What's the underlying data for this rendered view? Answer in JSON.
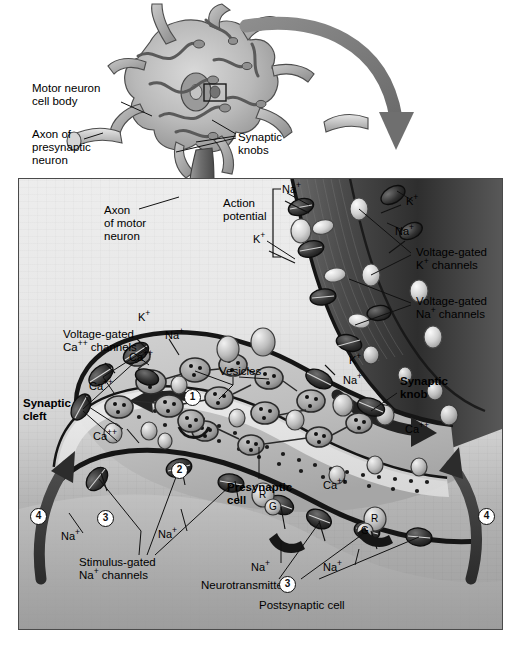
{
  "figure": {
    "domain": "biology-diagram"
  },
  "colors": {
    "panel_light": "#ededed",
    "panel_mid": "#c8c8c8",
    "panel_dark": "#a0a0a0",
    "membrane": "#2b2b2b",
    "channel_dark": "#3a3a3a",
    "channel_light": "#d8d8d8",
    "arrow_gray": "#7a7a7a",
    "border": "#4a4a4a",
    "text": "#000000"
  },
  "overview_labels": [
    {
      "id": "motor-neuron-cell-body",
      "text": "Motor neuron\ncell body",
      "x": 32,
      "y": 82
    },
    {
      "id": "axon-of-presynaptic-neuron",
      "text": "Axon of\npresynaptic\nneuron",
      "x": 32,
      "y": 128
    },
    {
      "id": "synaptic-knobs",
      "text": "Synaptic\nknobs",
      "x": 238,
      "y": 131
    }
  ],
  "panel_labels": [
    {
      "id": "axon-of-motor-neuron",
      "text": "Axon\nof motor\nneuron",
      "x": 103,
      "y": 203,
      "bold": false
    },
    {
      "id": "action-potential",
      "text": "Action\npotential",
      "x": 222,
      "y": 196,
      "bold": false
    },
    {
      "id": "voltage-gated-k-channels",
      "text": "Voltage-gated\nK⁺ channels",
      "x": 415,
      "y": 249,
      "bold": false
    },
    {
      "id": "voltage-gated-na-channels",
      "text": "Voltage-gated\nNa⁺ channels",
      "x": 415,
      "y": 297,
      "bold": false
    },
    {
      "id": "voltage-gated-ca-channels",
      "text": "Voltage-gated\nCa⁺⁺ channels",
      "x": 62,
      "y": 329,
      "bold": false
    },
    {
      "id": "synaptic-cleft",
      "text": "Synaptic\ncleft",
      "x": 22,
      "y": 400,
      "bold": true
    },
    {
      "id": "synaptic-knob",
      "text": "Synaptic\nknob",
      "x": 399,
      "y": 386,
      "bold": true
    },
    {
      "id": "vesicles",
      "text": "Vesicles",
      "x": 218,
      "y": 367,
      "bold": false
    },
    {
      "id": "presynaptic-cell",
      "text": "Presynaptic\ncell",
      "x": 228,
      "y": 490,
      "bold": true
    },
    {
      "id": "stimulus-gated-na-channels",
      "text": "Stimulus-gated\nNa⁺ channels",
      "x": 78,
      "y": 560,
      "bold": false
    },
    {
      "id": "neurotransmitters",
      "text": "Neurotransmitters",
      "x": 200,
      "y": 580,
      "bold": false
    },
    {
      "id": "postsynaptic-cell",
      "text": "Postsynaptic cell",
      "x": 258,
      "y": 600,
      "bold": false
    }
  ],
  "ion_labels": [
    {
      "id": "ion-na-1",
      "text": "Na⁺",
      "x": 281,
      "y": 190
    },
    {
      "id": "ion-k-1",
      "text": "K⁺",
      "x": 252,
      "y": 238
    },
    {
      "id": "ion-k-2",
      "text": "K⁺",
      "x": 405,
      "y": 202
    },
    {
      "id": "ion-na-2",
      "text": "Na⁺",
      "x": 394,
      "y": 232
    },
    {
      "id": "ion-k-3",
      "text": "K⁺",
      "x": 137,
      "y": 318
    },
    {
      "id": "ion-na-3",
      "text": "Na⁺",
      "x": 164,
      "y": 336
    },
    {
      "id": "ion-ca-1",
      "text": "Ca⁺⁺",
      "x": 128,
      "y": 358
    },
    {
      "id": "ion-ca-2",
      "text": "Ca⁺⁺",
      "x": 88,
      "y": 387
    },
    {
      "id": "ion-ca-3",
      "text": "Ca⁺⁺",
      "x": 92,
      "y": 437
    },
    {
      "id": "ion-k-4",
      "text": "K⁺",
      "x": 348,
      "y": 361
    },
    {
      "id": "ion-na-4",
      "text": "Na⁺",
      "x": 342,
      "y": 381
    },
    {
      "id": "ion-ca-4",
      "text": "Ca⁺⁺",
      "x": 404,
      "y": 430
    },
    {
      "id": "ion-ca-5",
      "text": "Ca⁺⁺",
      "x": 322,
      "y": 486
    },
    {
      "id": "ion-na-5",
      "text": "Na⁺",
      "x": 60,
      "y": 537
    },
    {
      "id": "ion-na-6",
      "text": "Na⁺",
      "x": 157,
      "y": 535
    },
    {
      "id": "ion-na-7",
      "text": "Na⁺",
      "x": 250,
      "y": 568
    },
    {
      "id": "ion-na-8",
      "text": "Na⁺",
      "x": 322,
      "y": 568
    },
    {
      "id": "ion-na-9",
      "text": "Na⁺",
      "x": 355,
      "y": 585
    }
  ],
  "steps": [
    {
      "id": "step-1",
      "number": "①",
      "x": 183,
      "y": 388
    },
    {
      "id": "step-2",
      "number": "②",
      "x": 170,
      "y": 461
    },
    {
      "id": "step-3a",
      "number": "③",
      "x": 96,
      "y": 509
    },
    {
      "id": "step-3b",
      "number": "③",
      "x": 278,
      "y": 575
    },
    {
      "id": "step-4a",
      "number": "④",
      "x": 29,
      "y": 507
    },
    {
      "id": "step-4b",
      "number": "④",
      "x": 477,
      "y": 507
    }
  ],
  "receptor_markers": [
    {
      "id": "receptor-r-1",
      "text": "R",
      "x": 277,
      "y": 547
    },
    {
      "id": "receptor-g-1",
      "text": "G",
      "x": 287,
      "y": 558
    },
    {
      "id": "receptor-r-2",
      "text": "R",
      "x": 390,
      "y": 533
    },
    {
      "id": "receptor-g-2",
      "text": "G",
      "x": 381,
      "y": 545
    }
  ],
  "icons": {
    "zoom_arrow": "curved-magnify-arrow-icon",
    "ion_channel": "ion-channel-icon",
    "vesicle": "synaptic-vesicle-icon",
    "neurotransmitter": "neurotransmitter-dot-icon"
  }
}
